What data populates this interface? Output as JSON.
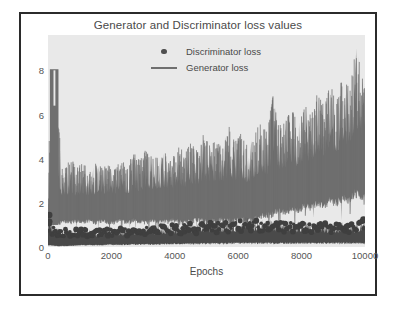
{
  "chart_data": {
    "type": "line",
    "title": "Generator and Discriminator loss values",
    "xlabel": "Epochs",
    "ylabel": "",
    "xlim": [
      0,
      10000
    ],
    "ylim": [
      0,
      9.6
    ],
    "grid": false,
    "legend_position": "upper center",
    "xticks": [
      0,
      2000,
      4000,
      6000,
      8000,
      10000
    ],
    "xticklabels": [
      "0",
      "2000",
      "4000",
      "6000",
      "8000",
      "10000"
    ],
    "yticks": [
      0,
      2,
      4,
      6,
      8
    ],
    "yticklabels": [
      "0",
      "2",
      "4",
      "6",
      "8"
    ],
    "series": [
      {
        "name": "Discriminator loss",
        "marker": "dot",
        "color": "#4f4f4f",
        "x": [
          0,
          100,
          200,
          300,
          400,
          500,
          700,
          900,
          1100,
          1300,
          1500,
          1700,
          1900,
          2100,
          2300,
          2500,
          2700,
          2900,
          3100,
          3300,
          3500,
          3700,
          3900,
          4100,
          4300,
          4500,
          4700,
          4900,
          5100,
          5300,
          5500,
          5700,
          5900,
          6100,
          6300,
          6500,
          6700,
          6900,
          7100,
          7300,
          7500,
          7700,
          7900,
          8100,
          8300,
          8500,
          8700,
          8900,
          9100,
          9300,
          9500,
          9700,
          9900,
          10000
        ],
        "envelope_high": [
          1.45,
          1.3,
          0.95,
          0.9,
          0.85,
          0.85,
          0.82,
          0.8,
          0.86,
          0.84,
          0.8,
          0.82,
          0.85,
          0.83,
          0.86,
          0.85,
          0.9,
          0.88,
          0.95,
          0.92,
          1.0,
          0.98,
          1.05,
          1.0,
          1.05,
          1.08,
          1.05,
          1.1,
          1.12,
          1.1,
          1.15,
          1.18,
          1.15,
          1.2,
          1.3,
          1.25,
          1.2,
          1.22,
          1.18,
          1.2,
          1.15,
          1.18,
          1.12,
          1.15,
          1.1,
          1.12,
          1.08,
          1.1,
          1.05,
          1.1,
          1.05,
          1.12,
          1.2,
          1.25
        ],
        "envelope_low": [
          0.1,
          0.08,
          0.06,
          0.05,
          0.05,
          0.05,
          0.06,
          0.08,
          0.1,
          0.1,
          0.1,
          0.1,
          0.12,
          0.12,
          0.12,
          0.12,
          0.14,
          0.14,
          0.14,
          0.14,
          0.15,
          0.15,
          0.16,
          0.16,
          0.16,
          0.17,
          0.17,
          0.18,
          0.18,
          0.18,
          0.18,
          0.2,
          0.2,
          0.2,
          0.2,
          0.2,
          0.2,
          0.2,
          0.2,
          0.2,
          0.2,
          0.2,
          0.2,
          0.2,
          0.2,
          0.2,
          0.2,
          0.2,
          0.2,
          0.2,
          0.2,
          0.2,
          0.2,
          0.2
        ],
        "mean": [
          0.75,
          0.6,
          0.5,
          0.48,
          0.45,
          0.45,
          0.45,
          0.45,
          0.48,
          0.48,
          0.46,
          0.47,
          0.5,
          0.5,
          0.5,
          0.5,
          0.52,
          0.52,
          0.55,
          0.54,
          0.58,
          0.57,
          0.6,
          0.58,
          0.6,
          0.62,
          0.61,
          0.64,
          0.65,
          0.64,
          0.67,
          0.68,
          0.67,
          0.7,
          0.74,
          0.72,
          0.7,
          0.71,
          0.69,
          0.7,
          0.67,
          0.68,
          0.65,
          0.67,
          0.64,
          0.65,
          0.63,
          0.64,
          0.62,
          0.64,
          0.62,
          0.65,
          0.7,
          0.72
        ]
      },
      {
        "name": "Generator loss",
        "marker": "line",
        "color": "#6f6f6f",
        "x": [
          0,
          80,
          160,
          240,
          320,
          400,
          500,
          700,
          900,
          1100,
          1300,
          1500,
          1700,
          1900,
          2100,
          2300,
          2500,
          2700,
          2900,
          3100,
          3300,
          3500,
          3700,
          3900,
          4100,
          4300,
          4500,
          4700,
          4900,
          5100,
          5300,
          5500,
          5700,
          5900,
          6100,
          6300,
          6500,
          6700,
          6900,
          7100,
          7300,
          7500,
          7700,
          7900,
          8100,
          8300,
          8500,
          8700,
          8900,
          9100,
          9300,
          9500,
          9700,
          9900,
          10000
        ],
        "envelope_high": [
          1.6,
          8.0,
          7.9,
          8.1,
          6.6,
          4.2,
          3.5,
          4.1,
          3.6,
          3.8,
          3.5,
          3.9,
          3.6,
          3.7,
          3.5,
          4.0,
          3.7,
          4.3,
          3.9,
          4.5,
          4.0,
          4.1,
          4.3,
          4.0,
          4.6,
          4.3,
          4.7,
          4.4,
          5.1,
          4.6,
          5.0,
          4.6,
          5.5,
          4.8,
          5.2,
          4.6,
          5.0,
          5.9,
          5.2,
          6.9,
          5.6,
          5.8,
          6.2,
          5.6,
          6.5,
          6.0,
          7.0,
          6.4,
          7.4,
          6.6,
          7.8,
          7.2,
          9.2,
          8.0,
          7.9
        ],
        "envelope_low": [
          0.9,
          1.0,
          0.9,
          1.1,
          1.0,
          1.0,
          1.1,
          1.0,
          1.1,
          1.0,
          1.1,
          1.0,
          1.1,
          1.0,
          1.0,
          1.1,
          1.0,
          1.1,
          1.0,
          1.0,
          1.1,
          1.0,
          1.0,
          1.1,
          1.0,
          1.0,
          1.0,
          1.1,
          1.0,
          1.0,
          1.0,
          1.1,
          1.0,
          1.0,
          1.1,
          1.0,
          1.1,
          1.2,
          1.3,
          1.3,
          1.5,
          1.4,
          1.6,
          1.5,
          1.7,
          1.6,
          1.8,
          1.7,
          1.9,
          1.8,
          2.0,
          1.9,
          2.2,
          2.1,
          2.2
        ],
        "mean": [
          1.2,
          3.0,
          3.2,
          3.0,
          2.8,
          2.4,
          2.3,
          2.4,
          2.3,
          2.4,
          2.3,
          2.4,
          2.4,
          2.4,
          2.4,
          2.5,
          2.4,
          2.6,
          2.5,
          2.7,
          2.6,
          2.6,
          2.7,
          2.6,
          2.8,
          2.7,
          2.9,
          2.8,
          3.0,
          2.9,
          3.0,
          2.9,
          3.2,
          3.0,
          3.1,
          2.9,
          3.1,
          3.4,
          3.2,
          3.9,
          3.5,
          3.6,
          3.8,
          3.6,
          4.0,
          3.8,
          4.3,
          4.0,
          4.5,
          4.2,
          4.8,
          4.5,
          5.5,
          5.0,
          5.0
        ]
      }
    ],
    "annotations": []
  }
}
